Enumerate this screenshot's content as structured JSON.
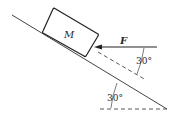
{
  "diagram": {
    "type": "physics-incline",
    "block": {
      "label": "M"
    },
    "force": {
      "label": "F",
      "direction": "horizontal, pushing left into block"
    },
    "angles": [
      {
        "label": "30°",
        "between": "applied force and incline-parallel dashed line"
      },
      {
        "label": "30°",
        "between": "incline and horizontal"
      }
    ],
    "colors": {
      "line": "#333333",
      "background": "#ffffff"
    }
  }
}
